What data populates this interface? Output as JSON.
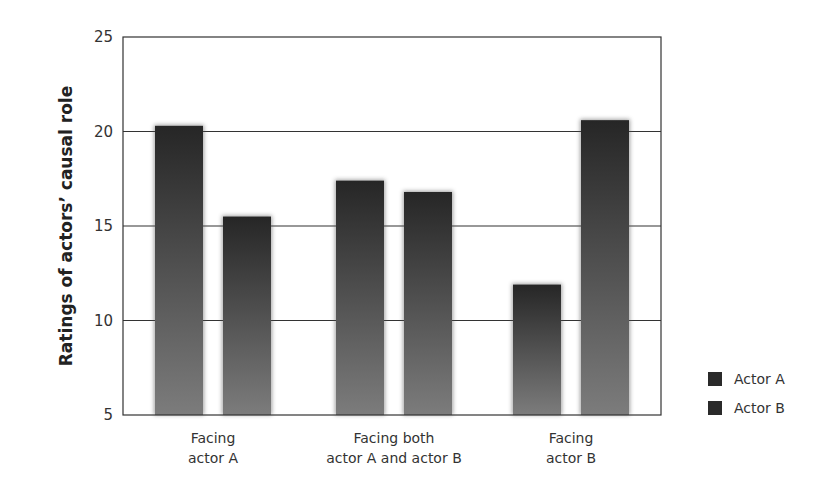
{
  "chart_data": {
    "type": "bar",
    "title": "",
    "xlabel": "",
    "ylabel": "Ratings of actors’ causal role",
    "ylim": [
      5,
      25
    ],
    "yticks": [
      5,
      10,
      15,
      20,
      25
    ],
    "grid": true,
    "legend_position": "right-bottom",
    "categories": [
      [
        "Facing",
        "actor A"
      ],
      [
        "Facing both",
        "actor A and actor B"
      ],
      [
        "Facing",
        "actor B"
      ]
    ],
    "series": [
      {
        "name": "Actor A",
        "values": [
          20.3,
          17.4,
          11.9
        ]
      },
      {
        "name": "Actor B",
        "values": [
          15.5,
          16.8,
          20.6
        ]
      }
    ]
  },
  "legend": {
    "items": [
      {
        "label": "Actor A"
      },
      {
        "label": "Actor B"
      }
    ]
  },
  "colors": {
    "bar_top": "#2a2a2a",
    "bar_bottom": "#7a7a7a",
    "axis": "#333333",
    "grid": "#333333"
  }
}
